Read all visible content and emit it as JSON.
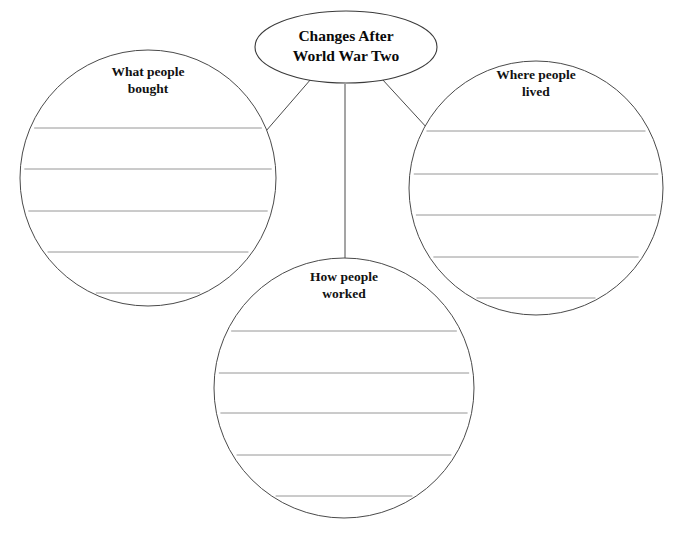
{
  "page": {
    "background_color": "#ffffff",
    "width": 675,
    "height": 536
  },
  "colors": {
    "outline": "#4a4a4a",
    "center_outline": "#3a3a3a",
    "rule_line": "#8a8a8a",
    "text": "#111111",
    "fill": "#ffffff"
  },
  "center": {
    "name": "center-topic",
    "shape": "ellipse",
    "line1": "Changes After",
    "line2": "World War Two",
    "cx": 346,
    "cy": 47,
    "rx": 91,
    "ry": 36
  },
  "bubbles": [
    {
      "name": "bubble-what-people-bought",
      "shape": "circle",
      "line1": "What people",
      "line2": "bought",
      "cx": 148,
      "cy": 178,
      "r": 128,
      "label_y": 73,
      "rule_count": 5,
      "rule_rows": [
        128,
        169,
        211,
        252,
        293
      ]
    },
    {
      "name": "bubble-where-people-lived",
      "shape": "circle",
      "line1": "Where people",
      "line2": "lived",
      "cx": 536,
      "cy": 188,
      "r": 127,
      "label_y": 76,
      "rule_count": 5,
      "rule_rows": [
        131,
        174,
        215,
        257,
        298
      ]
    },
    {
      "name": "bubble-how-people-worked",
      "shape": "circle",
      "line1": "How people",
      "line2": "worked",
      "cx": 344,
      "cy": 388,
      "r": 130,
      "label_y": 278,
      "rule_count": 5,
      "rule_rows": [
        331,
        373,
        413,
        455,
        496
      ]
    }
  ],
  "connectors": [
    {
      "name": "connector-to-what-people-bought",
      "x1": 311,
      "y1": 79,
      "x2": 266,
      "y2": 131
    },
    {
      "name": "connector-to-how-people-worked",
      "x1": 345,
      "y1": 84,
      "x2": 345,
      "y2": 259
    },
    {
      "name": "connector-to-where-people-lived",
      "x1": 382,
      "y1": 79,
      "x2": 428,
      "y2": 129
    }
  ]
}
